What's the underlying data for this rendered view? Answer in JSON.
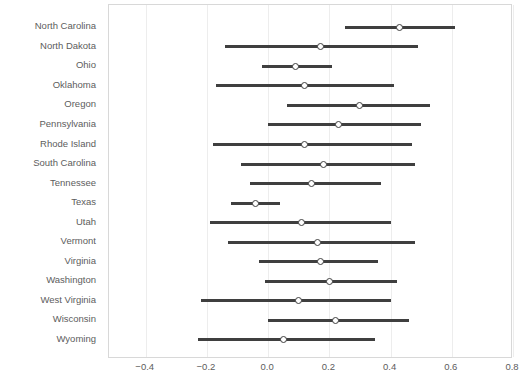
{
  "chart_data": {
    "type": "scatter",
    "title": "",
    "subtitle": "",
    "xlabel": "",
    "ylabel": "",
    "orientation": "horizontal",
    "grid": true,
    "legend": false,
    "xlim": [
      -0.52,
      0.8
    ],
    "xticks": [
      -0.4,
      -0.2,
      0.0,
      0.2,
      0.4,
      0.6,
      0.8
    ],
    "xticklabels": [
      "−0.4",
      "−0.2",
      "0.0",
      "0.2",
      "0.4",
      "0.6",
      "0.8"
    ],
    "categories": [
      "North Carolina",
      "North Dakota",
      "Ohio",
      "Oklahoma",
      "Oregon",
      "Pennsylvania",
      "Rhode Island",
      "South Carolina",
      "Tennessee",
      "Texas",
      "Utah",
      "Vermont",
      "Virginia",
      "Washington",
      "West Virginia",
      "Wisconsin",
      "Wyoming"
    ],
    "values": [
      0.43,
      0.17,
      0.09,
      0.12,
      0.3,
      0.23,
      0.12,
      0.18,
      0.14,
      -0.04,
      0.11,
      0.16,
      0.17,
      0.2,
      0.1,
      0.22,
      0.05
    ],
    "ci_low": [
      0.25,
      -0.14,
      -0.02,
      -0.17,
      0.06,
      0.0,
      -0.18,
      -0.09,
      -0.06,
      -0.12,
      -0.19,
      -0.13,
      -0.03,
      -0.01,
      -0.22,
      0.0,
      -0.23
    ],
    "ci_high": [
      0.61,
      0.49,
      0.21,
      0.41,
      0.53,
      0.5,
      0.47,
      0.48,
      0.37,
      0.04,
      0.4,
      0.48,
      0.36,
      0.42,
      0.4,
      0.46,
      0.35
    ],
    "colors": {
      "line": "#3f3f3f",
      "marker_fill": "#ffffff",
      "marker_edge": "#3f3f3f",
      "grid": "#ededed",
      "frame": "#d8d8d8",
      "text": "#5d5d5d",
      "background": "#ffffff"
    }
  }
}
